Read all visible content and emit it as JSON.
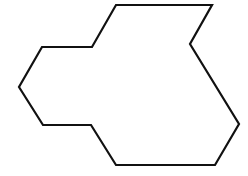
{
  "diagram": {
    "type": "polygon-outline",
    "stroke_color": "#111111",
    "fill_color": "#ffffff",
    "background_color": "#ffffff",
    "stroke_width": 2.2,
    "vertices": [
      [
        116,
        5
      ],
      [
        212,
        5
      ],
      [
        190,
        44
      ],
      [
        239,
        124
      ],
      [
        215,
        165
      ],
      [
        116,
        165
      ],
      [
        91,
        125
      ],
      [
        43,
        125
      ],
      [
        19,
        87
      ],
      [
        42,
        47
      ],
      [
        92,
        47
      ]
    ]
  }
}
